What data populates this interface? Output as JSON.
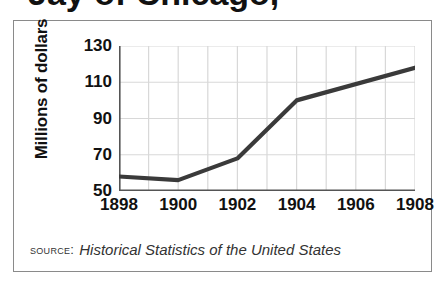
{
  "figure": {
    "clipped_title_fragment": "Jay of Chicago,",
    "source_label": "Source:",
    "source_title": "Historical Statistics of the United States"
  },
  "colors": {
    "line": "#3a3a3a",
    "grid": "#d8d8d8",
    "axis": "#555555",
    "border": "#8a8a8a",
    "text": "#111111",
    "source_text": "#333333",
    "background": "#ffffff"
  },
  "chart_data": {
    "type": "line",
    "title": "",
    "xlabel": "",
    "ylabel": "Millions of dollars",
    "x": [
      1898,
      1899,
      1900,
      1901,
      1902,
      1903,
      1904,
      1905,
      1906,
      1907,
      1908
    ],
    "values": [
      58,
      57,
      56,
      62,
      68,
      84,
      100,
      105,
      110,
      114,
      118
    ],
    "series": [
      {
        "name": "Millions of dollars",
        "values": [
          58,
          57,
          56,
          62,
          68,
          84,
          100,
          105,
          110,
          114,
          118
        ]
      }
    ],
    "vertices": [
      {
        "x": 1898,
        "y": 58
      },
      {
        "x": 1900,
        "y": 56
      },
      {
        "x": 1902,
        "y": 68
      },
      {
        "x": 1904,
        "y": 100
      },
      {
        "x": 1908,
        "y": 118
      }
    ],
    "xlim": [
      1898,
      1908
    ],
    "ylim": [
      50,
      130
    ],
    "ytick_labels": [
      "130",
      "110",
      "90",
      "70",
      "50"
    ],
    "yticks": [
      130,
      110,
      90,
      70,
      50
    ],
    "xtick_labels": [
      "1898",
      "1900",
      "1902",
      "1904",
      "1906",
      "1908"
    ],
    "xticks": [
      1898,
      1900,
      1902,
      1904,
      1906,
      1908
    ],
    "grid": true,
    "grid_x_step": 1,
    "grid_y_step": 20,
    "legend": "none"
  }
}
